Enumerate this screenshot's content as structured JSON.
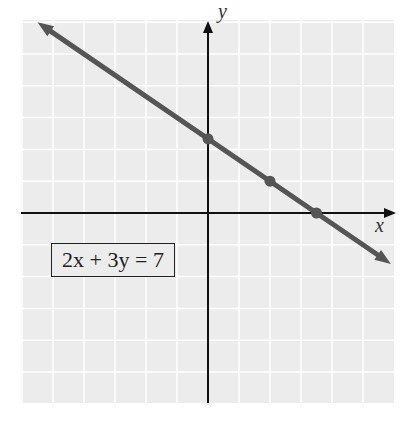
{
  "chart_data": {
    "type": "line",
    "title": "",
    "equation": "2x + 3y = 7",
    "xlabel": "x",
    "ylabel": "y",
    "grid": true,
    "xlim": [
      -6,
      6
    ],
    "ylim": [
      -6,
      6
    ],
    "series": [
      {
        "name": "2x + 3y = 7",
        "x": [
          -5.5,
          5.9
        ],
        "y": [
          6.0,
          -1.6
        ]
      }
    ],
    "points": [
      {
        "x": 0,
        "y": 2.333
      },
      {
        "x": 2,
        "y": 1
      },
      {
        "x": 3.5,
        "y": 0
      }
    ]
  },
  "labels": {
    "equation": "2x + 3y = 7",
    "x_axis": "x",
    "y_axis": "y"
  },
  "colors": {
    "grid_bg": "#ececec",
    "grid_line": "#ffffff",
    "axis": "#111111",
    "line": "#555555",
    "point": "#555555"
  }
}
